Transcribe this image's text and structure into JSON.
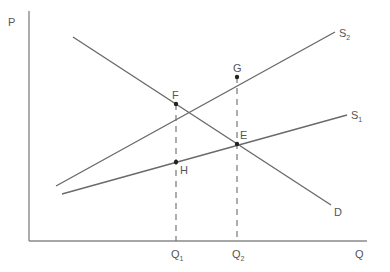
{
  "diagram": {
    "type": "supply-demand",
    "axes": {
      "y_label": "P",
      "x_label": "Q"
    },
    "curves": {
      "demand": {
        "label": "D"
      },
      "supply_1": {
        "label": "S",
        "subscript": "1"
      },
      "supply_2": {
        "label": "S",
        "subscript": "2"
      }
    },
    "points": {
      "F": "F",
      "G": "G",
      "E": "E",
      "H": "H"
    },
    "quantities": {
      "q1": {
        "label": "Q",
        "subscript": "1"
      },
      "q2": {
        "label": "Q",
        "subscript": "2"
      }
    },
    "colors": {
      "axis": "#8a8a8a",
      "line": "#6a6a6a",
      "point": "#222222",
      "text": "#555555"
    }
  }
}
